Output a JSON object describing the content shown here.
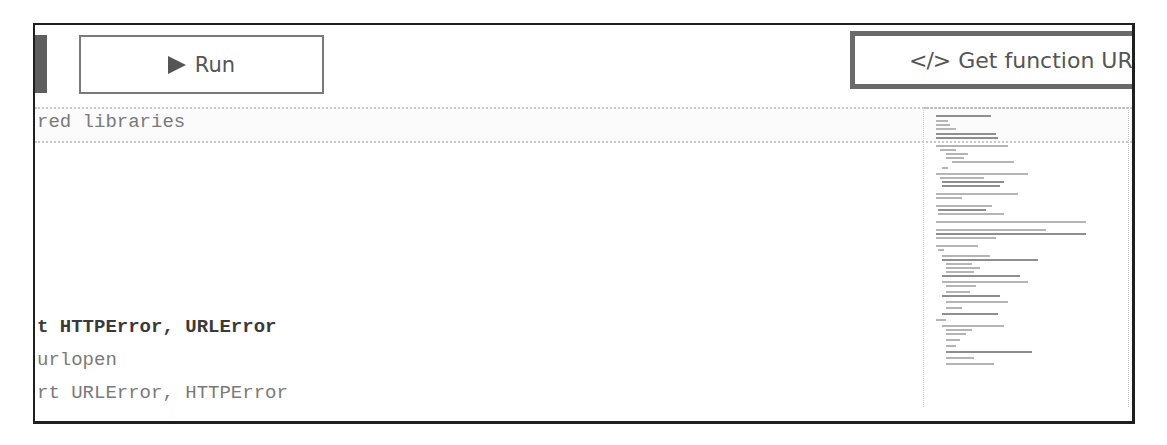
{
  "toolbar": {
    "run_label": "Run",
    "run_icon": "play-icon",
    "url_label": "Get function URL",
    "url_icon_glyph": "</>",
    "url_icon": "code-icon"
  },
  "editor": {
    "lines": [
      {
        "text": "red libraries",
        "style": "comment",
        "current": true
      },
      {
        "text": "",
        "style": "blank"
      },
      {
        "text": "",
        "style": "blank"
      },
      {
        "text": "",
        "style": "blank"
      },
      {
        "text": "",
        "style": "blank"
      },
      {
        "text": "",
        "style": "blank"
      },
      {
        "text": "t HTTPError, URLError",
        "style": "strong"
      },
      {
        "text": "urlopen",
        "style": "normal"
      },
      {
        "text": "rt URLError, HTTPError",
        "style": "normal"
      }
    ]
  },
  "colors": {
    "frame_border": "#1f1f1f",
    "button_border": "#7a7a7a",
    "url_button_border": "#6a6a6a",
    "button_text": "#555555",
    "code_text": "#7a7a7a",
    "code_text_strong": "#3a3a3a",
    "current_line_border": "#c8c8c8"
  }
}
